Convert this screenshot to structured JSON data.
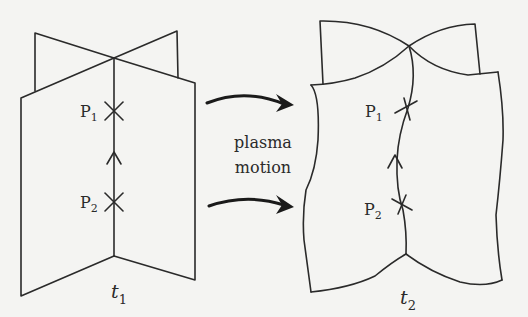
{
  "figure": {
    "left_panel": {
      "time_label": {
        "symbol": "t",
        "subscript": "1"
      },
      "points": [
        {
          "symbol": "P",
          "subscript": "1"
        },
        {
          "symbol": "P",
          "subscript": "2"
        }
      ]
    },
    "right_panel": {
      "time_label": {
        "symbol": "t",
        "subscript": "2"
      },
      "points": [
        {
          "symbol": "P",
          "subscript": "1"
        },
        {
          "symbol": "P",
          "subscript": "2"
        }
      ]
    },
    "transition": {
      "line1": "plasma",
      "line2": "motion",
      "arrow_count": 2
    }
  },
  "colors": {
    "background": "#f4f4f2",
    "ink": "#2a2a2a"
  }
}
